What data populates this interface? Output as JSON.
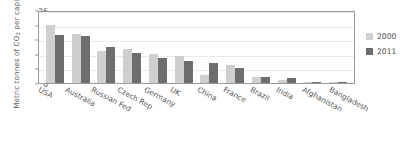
{
  "chart_data": {
    "type": "bar",
    "title": "",
    "xlabel": "",
    "ylabel": "Metric tonnes of CO2 per capita",
    "ylabel_prefix": "Metric tonnes of CO",
    "ylabel_sub": "2",
    "ylabel_suffix": " per capita",
    "ylim": [
      0,
      25
    ],
    "yticks": [
      0,
      5,
      10,
      15,
      20,
      25
    ],
    "grid": true,
    "legend_position": "right",
    "categories": [
      "USA",
      "Australia",
      "Russian Fed",
      "Czech Rep",
      "Germany",
      "UK",
      "China",
      "France",
      "Brazil",
      "India",
      "Afghanistan",
      "Bangladesh"
    ],
    "series": [
      {
        "name": "2000",
        "color": "#cfcfcf",
        "values": [
          19.9,
          16.9,
          10.8,
          11.7,
          10.0,
          9.3,
          2.7,
          6.2,
          1.9,
          0.9,
          0.3,
          0.2
        ]
      },
      {
        "name": "2011",
        "color": "#6e6e6e",
        "values": [
          16.3,
          16.0,
          12.4,
          10.4,
          8.5,
          7.5,
          6.7,
          5.2,
          2.2,
          1.6,
          0.3,
          0.4
        ]
      }
    ]
  },
  "legend": {
    "items": [
      {
        "label": "2000",
        "color": "#cfcfcf"
      },
      {
        "label": "2011",
        "color": "#6e6e6e"
      }
    ]
  },
  "colors": {
    "series_2000": "#cfcfcf",
    "series_2011": "#6e6e6e",
    "axis": "#9a9a9a",
    "grid": "#e9e9e9",
    "text": "#5b5b5b"
  }
}
